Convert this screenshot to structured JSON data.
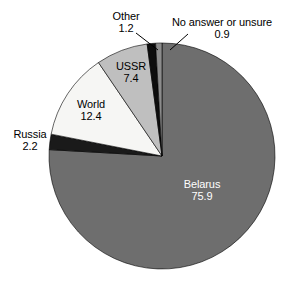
{
  "chart_data": {
    "type": "pie",
    "title": "",
    "subtitle": "",
    "xlabel": "",
    "ylabel": "",
    "legend_position": "none",
    "labels_position": "outside-and-inside",
    "grid": false,
    "units": "percent",
    "total": 100.0,
    "start_angle_deg": 0,
    "direction": "clockwise",
    "categories": [
      "Belarus",
      "Russia",
      "World",
      "USSR",
      "Other",
      "No answer or unsure"
    ],
    "values": [
      75.9,
      2.2,
      12.4,
      7.4,
      1.2,
      0.9
    ],
    "colors": [
      "#6e6e6e",
      "#1a1a1a",
      "#f6f6f4",
      "#bfbfbf",
      "#0d0d0d",
      "#8c8c8c"
    ],
    "slices": [
      {
        "name": "Belarus",
        "value": 75.9,
        "value_text": "75.9",
        "color": "#6e6e6e",
        "label_color": "#ffffff",
        "label_placement": "inside",
        "leader_line": false
      },
      {
        "name": "Russia",
        "value": 2.2,
        "value_text": "2.2",
        "color": "#1a1a1a",
        "label_color": "#000000",
        "label_placement": "outside",
        "leader_line": false
      },
      {
        "name": "World",
        "value": 12.4,
        "value_text": "12.4",
        "color": "#f6f6f4",
        "label_color": "#000000",
        "label_placement": "inside",
        "leader_line": false
      },
      {
        "name": "USSR",
        "value": 7.4,
        "value_text": "7.4",
        "color": "#bfbfbf",
        "label_color": "#000000",
        "label_placement": "inside",
        "leader_line": false
      },
      {
        "name": "Other",
        "value": 1.2,
        "value_text": "1.2",
        "color": "#0d0d0d",
        "label_color": "#000000",
        "label_placement": "outside",
        "leader_line": true
      },
      {
        "name": "No answer or unsure",
        "value": 0.9,
        "value_text": "0.9",
        "color": "#8c8c8c",
        "label_color": "#000000",
        "label_placement": "outside",
        "leader_line": true
      }
    ]
  }
}
